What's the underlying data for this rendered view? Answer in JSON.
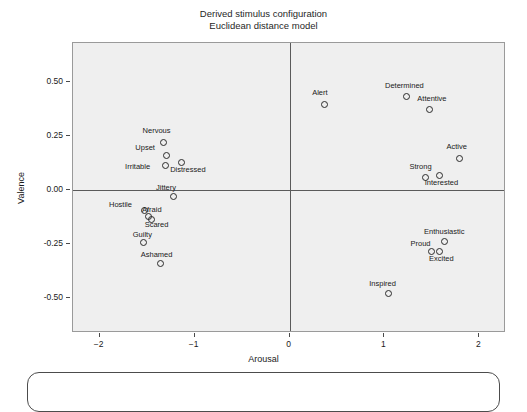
{
  "chart_data": {
    "type": "scatter",
    "title": "Derived stimulus configuration",
    "subtitle": "Euclidean distance model",
    "xlabel": "Arousal",
    "ylabel": "Valence",
    "xlim": [
      -2.28,
      2.28
    ],
    "ylim": [
      -0.66,
      0.68
    ],
    "xticks": [
      "-2",
      "-1",
      "0",
      "1",
      "2"
    ],
    "xtick_values": [
      -2,
      -1,
      0,
      1,
      2
    ],
    "yticks": [
      "0.50",
      "0.25",
      "0.00",
      "-0.25",
      "-0.50"
    ],
    "ytick_values": [
      0.5,
      0.25,
      0,
      -0.25,
      -0.5
    ],
    "grid": false,
    "reference_lines": {
      "vertical_x": 0,
      "horizontal_y": 0
    },
    "legend": "none",
    "marker": "open-circle",
    "panel_color": "#efefef",
    "point_color": "#2b2b2b",
    "points": [
      {
        "label": "Nervous",
        "x": -1.33,
        "y": 0.223,
        "lx": -1.4,
        "ly": 0.275
      },
      {
        "label": "Upset",
        "x": -1.3,
        "y": 0.164,
        "lx": -1.52,
        "ly": 0.195
      },
      {
        "label": "Irritable",
        "x": -1.31,
        "y": 0.118,
        "lx": -1.6,
        "ly": 0.105
      },
      {
        "label": "Distressed",
        "x": -1.14,
        "y": 0.132,
        "lx": -1.07,
        "ly": 0.095
      },
      {
        "label": "Jittery",
        "x": -1.23,
        "y": -0.027,
        "lx": -1.3,
        "ly": 0.012
      },
      {
        "label": "Hostile",
        "x": -1.53,
        "y": -0.091,
        "lx": -1.78,
        "ly": -0.068
      },
      {
        "label": "Afraid",
        "x": -1.49,
        "y": -0.118,
        "lx": -1.45,
        "ly": -0.091
      },
      {
        "label": "Scared",
        "x": -1.46,
        "y": -0.132,
        "lx": -1.4,
        "ly": -0.159
      },
      {
        "label": "Guilty",
        "x": -1.54,
        "y": -0.241,
        "lx": -1.55,
        "ly": -0.209
      },
      {
        "label": "Ashamed",
        "x": -1.36,
        "y": -0.336,
        "lx": -1.4,
        "ly": -0.3
      },
      {
        "label": "Alert",
        "x": 0.36,
        "y": 0.4,
        "lx": 0.32,
        "ly": 0.45
      },
      {
        "label": "Determined",
        "x": 1.23,
        "y": 0.436,
        "lx": 1.21,
        "ly": 0.482
      },
      {
        "label": "Attentive",
        "x": 1.47,
        "y": 0.373,
        "lx": 1.5,
        "ly": 0.42
      },
      {
        "label": "Active",
        "x": 1.79,
        "y": 0.15,
        "lx": 1.76,
        "ly": 0.2
      },
      {
        "label": "Strong",
        "x": 1.43,
        "y": 0.059,
        "lx": 1.38,
        "ly": 0.105
      },
      {
        "label": "Interested",
        "x": 1.57,
        "y": 0.068,
        "lx": 1.6,
        "ly": 0.032
      },
      {
        "label": "Enthusiastic",
        "x": 1.63,
        "y": -0.236,
        "lx": 1.63,
        "ly": -0.191
      },
      {
        "label": "Proud",
        "x": 1.49,
        "y": -0.282,
        "lx": 1.38,
        "ly": -0.25
      },
      {
        "label": "Excited",
        "x": 1.57,
        "y": -0.282,
        "lx": 1.6,
        "ly": -0.318
      },
      {
        "label": "Inspired",
        "x": 1.04,
        "y": -0.477,
        "lx": 0.98,
        "ly": -0.432
      }
    ]
  }
}
